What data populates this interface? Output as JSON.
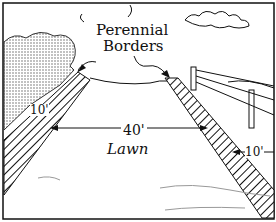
{
  "diagram": {
    "labels": {
      "borders_line1": "Perennial",
      "borders_line2": "Borders",
      "lawn_width": "40'",
      "lawn": "Lawn",
      "left_border_width": "10'",
      "right_border_width": "10'"
    },
    "colors": {
      "ink": "#111111",
      "background": "#ffffff",
      "shrub": "#777777"
    }
  }
}
